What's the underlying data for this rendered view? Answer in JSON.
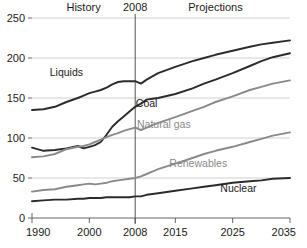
{
  "chart_data": {
    "type": "line",
    "title": "",
    "xlabel": "",
    "ylabel": "",
    "xlim": [
      1990,
      2035
    ],
    "ylim": [
      0,
      250
    ],
    "xticks": [
      1990,
      2000,
      2008,
      2015,
      2025,
      2035
    ],
    "xticklabels": [
      "1990",
      "2000",
      "2008",
      "2015",
      "2025",
      "2035"
    ],
    "yticks": [
      0,
      50,
      100,
      150,
      200,
      250
    ],
    "yticklabels": [
      "0",
      "50",
      "100",
      "150",
      "200",
      "250"
    ],
    "grid": "horizontal",
    "legend": "inline-labels",
    "annotations": [
      {
        "text": "History",
        "x": 1999,
        "y": 252,
        "name": "history-label"
      },
      {
        "text": "2008",
        "x": 2008,
        "y": 252,
        "name": "year-divider-label"
      },
      {
        "text": "Projections",
        "x": 2022,
        "y": 252,
        "name": "projections-label"
      }
    ],
    "divider": {
      "x": 2008,
      "label": "2008"
    },
    "x": [
      1990,
      1992,
      1994,
      1996,
      1998,
      1999,
      2000,
      2001,
      2002,
      2003,
      2004,
      2005,
      2006,
      2007,
      2008,
      2009,
      2010,
      2011,
      2012,
      2015,
      2018,
      2020,
      2022,
      2025,
      2028,
      2030,
      2032,
      2035
    ],
    "series": [
      {
        "name": "Liquids",
        "color": "#2b2b2b",
        "label_x": 1996,
        "label_y": 178,
        "values": [
          135,
          136,
          139,
          145,
          150,
          153,
          156,
          158,
          160,
          163,
          167,
          170,
          171,
          171,
          171,
          168,
          173,
          177,
          181,
          189,
          196,
          200,
          204,
          209,
          214,
          217,
          219,
          222
        ]
      },
      {
        "name": "Coal",
        "color": "#2b2b2b",
        "label_x": 2010,
        "label_y": 139,
        "values": [
          88,
          84,
          85,
          87,
          90,
          87,
          89,
          91,
          95,
          104,
          114,
          121,
          127,
          133,
          139,
          143,
          148,
          149,
          150,
          155,
          162,
          168,
          173,
          181,
          190,
          196,
          201,
          206
        ]
      },
      {
        "name": "Natural gas",
        "color": "#8a8a8a",
        "label_x": 2013,
        "label_y": 113,
        "values": [
          76,
          77,
          80,
          86,
          89,
          90,
          92,
          95,
          98,
          101,
          104,
          106,
          109,
          111,
          113,
          110,
          113,
          116,
          119,
          126,
          134,
          139,
          145,
          152,
          160,
          164,
          168,
          172
        ]
      },
      {
        "name": "Renewables",
        "color": "#8a8a8a",
        "label_x": 2019,
        "label_y": 64,
        "values": [
          33,
          35,
          36,
          39,
          41,
          42,
          43,
          42,
          43,
          44,
          46,
          47,
          48,
          49,
          50,
          52,
          55,
          58,
          61,
          68,
          75,
          80,
          84,
          89,
          95,
          99,
          103,
          107
        ]
      },
      {
        "name": "Nuclear",
        "color": "#2b2b2b",
        "label_x": 2026,
        "label_y": 33,
        "values": [
          21,
          22,
          23,
          23,
          24,
          24,
          25,
          25,
          25,
          26,
          26,
          26,
          26,
          26,
          27,
          27,
          29,
          30,
          31,
          34,
          37,
          39,
          41,
          44,
          46,
          47,
          49,
          50
        ]
      }
    ]
  }
}
